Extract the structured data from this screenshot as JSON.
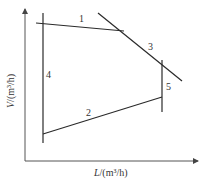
{
  "figure": {
    "type": "operating-line diagram",
    "axes": {
      "x": {
        "variable": "L",
        "unit": "(m³/h)",
        "label": "L/(m³/h)"
      },
      "y": {
        "variable": "V",
        "unit": "(m³/h)",
        "label": "V/(m³/h)"
      }
    },
    "lines": [
      {
        "id": "1",
        "label": "1",
        "x1": 36,
        "y1": 23,
        "x2": 124,
        "y2": 31
      },
      {
        "id": "2",
        "label": "2",
        "x1": 43,
        "y1": 134,
        "x2": 162,
        "y2": 97
      },
      {
        "id": "3",
        "label": "3",
        "x1": 98,
        "y1": 13,
        "x2": 182,
        "y2": 81
      },
      {
        "id": "4",
        "label": "4",
        "x1": 43,
        "y1": 13,
        "x2": 43,
        "y2": 143
      },
      {
        "id": "5",
        "label": "5",
        "x1": 162,
        "y1": 60,
        "x2": 162,
        "y2": 112
      }
    ],
    "label_positions": {
      "1": {
        "x": 79,
        "y": 22
      },
      "2": {
        "x": 86,
        "y": 116
      },
      "3": {
        "x": 148,
        "y": 50
      },
      "4": {
        "x": 46,
        "y": 78
      },
      "5": {
        "x": 166,
        "y": 90
      }
    },
    "colors": {
      "line": "#2a2a2a",
      "axis": "#555555",
      "text": "#333333",
      "background": "#ffffff"
    }
  }
}
